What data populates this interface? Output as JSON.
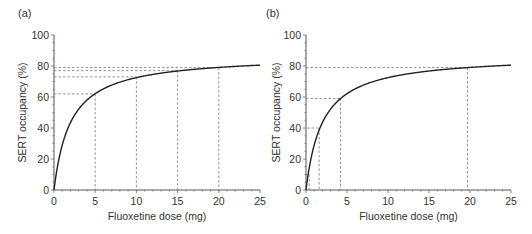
{
  "figure": {
    "panels": [
      {
        "panel_label": "(a)",
        "xlabel": "Fluoxetine dose (mg)",
        "ylabel": "SERT occupancy (%)"
      },
      {
        "panel_label": "(b)",
        "xlabel": "Fluoxetine dose (mg)",
        "ylabel": "SERT occupancy (%)"
      }
    ]
  },
  "chart_data": [
    {
      "type": "line",
      "title": "(a)",
      "xlabel": "Fluoxetine dose (mg)",
      "ylabel": "SERT occupancy (%)",
      "xlim": [
        0,
        25
      ],
      "ylim": [
        0,
        100
      ],
      "xticks": [
        0,
        5,
        10,
        15,
        20,
        25
      ],
      "yticks": [
        0,
        20,
        40,
        60,
        80,
        100
      ],
      "grid": false,
      "legend": null,
      "curve": {
        "model": "Emax*dose/(ED50+dose)",
        "Emax": 87,
        "ED50": 2.0
      },
      "series": [
        {
          "name": "SERT occupancy",
          "x": [
            0,
            1,
            2,
            3,
            4,
            5,
            7.5,
            10,
            12.5,
            15,
            17.5,
            20,
            22.5,
            25
          ],
          "y": [
            0,
            29,
            43.5,
            52.2,
            58,
            62.1,
            68.7,
            72.5,
            75,
            76.8,
            78.1,
            79.1,
            79.9,
            80.6
          ]
        }
      ],
      "annotations": [
        {
          "dose": 5,
          "occupancy": 62
        },
        {
          "dose": 10,
          "occupancy": 73
        },
        {
          "dose": 15,
          "occupancy": 77
        },
        {
          "dose": 20,
          "occupancy": 79
        }
      ]
    },
    {
      "type": "line",
      "title": "(b)",
      "xlabel": "Fluoxetine dose (mg)",
      "ylabel": "SERT occupancy (%)",
      "xlim": [
        0,
        25
      ],
      "ylim": [
        0,
        100
      ],
      "xticks": [
        0,
        5,
        10,
        15,
        20,
        25
      ],
      "yticks": [
        0,
        20,
        40,
        60,
        80,
        100
      ],
      "grid": false,
      "legend": null,
      "curve": {
        "model": "Emax*dose/(ED50+dose)",
        "Emax": 87,
        "ED50": 2.0
      },
      "series": [
        {
          "name": "SERT occupancy",
          "x": [
            0,
            1,
            2,
            3,
            4,
            5,
            7.5,
            10,
            12.5,
            15,
            17.5,
            20,
            22.5,
            25
          ],
          "y": [
            0,
            29,
            43.5,
            52.2,
            58,
            62.1,
            68.7,
            72.5,
            75,
            76.8,
            78.1,
            79.1,
            79.9,
            80.6
          ]
        }
      ],
      "annotations": [
        {
          "dose": 0.4,
          "occupancy": 10,
          "hline": "short"
        },
        {
          "dose": 1.6,
          "occupancy": 40,
          "hline": "short"
        },
        {
          "dose": 4.2,
          "occupancy": 59
        },
        {
          "dose": 19.7,
          "occupancy": 79
        }
      ]
    }
  ]
}
